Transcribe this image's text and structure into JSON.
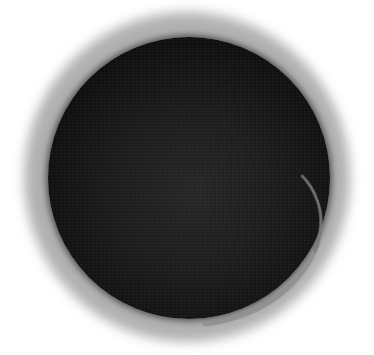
{
  "image": {
    "subject": "dark circular liquid surface in a white cup viewed from above",
    "colors": {
      "background": "#ffffff",
      "halo": "#b5b5b5",
      "disk_center": "#262626",
      "disk_edge": "#050505",
      "rim_highlight": "#8f8f8f"
    }
  }
}
